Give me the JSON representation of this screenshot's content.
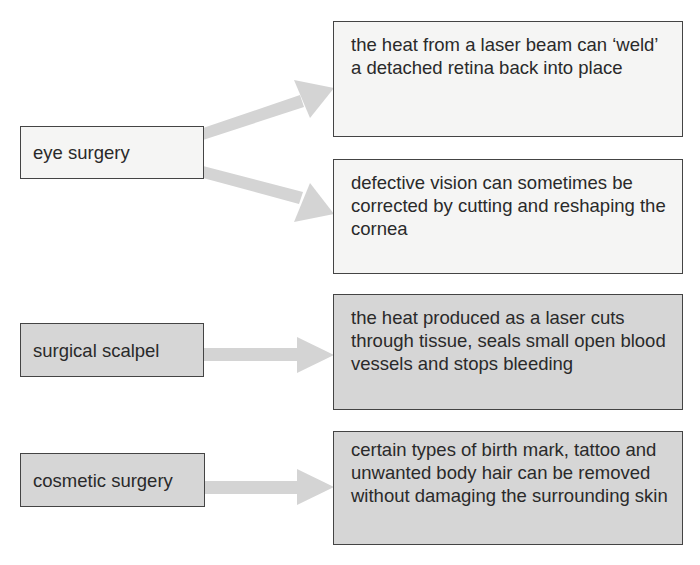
{
  "cropped_header_text": "",
  "colors": {
    "light_box": "#f5f5f4",
    "dark_box": "#d6d6d6",
    "border": "#444444",
    "arrow": "#d4d4d4",
    "text": "#2a2a2a"
  },
  "groups": [
    {
      "source": "eye surgery",
      "style": "light",
      "targets": [
        "the heat from a laser beam can ‘weld’ a detached retina back into place",
        "defective vision can sometimes be corrected by cutting and reshaping the cornea"
      ]
    },
    {
      "source": "surgical scalpel",
      "style": "dark",
      "targets": [
        "the heat produced as a laser cuts through tissue, seals small open blood vessels and stops bleeding"
      ]
    },
    {
      "source": "cosmetic surgery",
      "style": "dark",
      "targets": [
        "certain types of birth mark, tattoo and unwanted body hair can be removed without damaging the surrounding skin"
      ]
    }
  ]
}
